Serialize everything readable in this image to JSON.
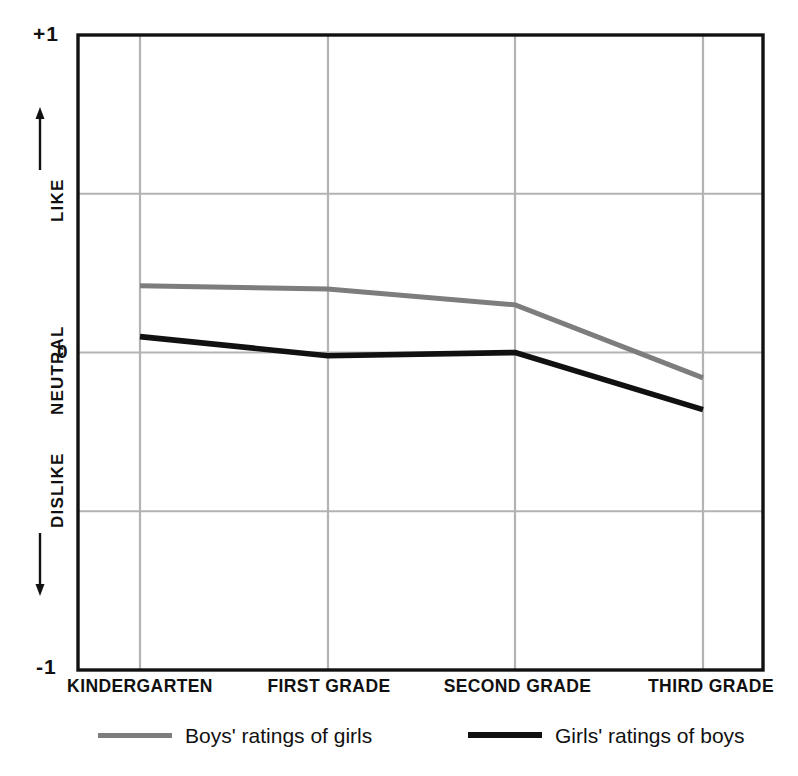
{
  "chart_data": {
    "type": "line",
    "title": "",
    "xlabel": "",
    "ylabel": "",
    "categories": [
      "KINDERGARTEN",
      "FIRST GRADE",
      "SECOND GRADE",
      "THIRD GRADE"
    ],
    "ylim": [
      -1,
      1
    ],
    "yticks": [
      1,
      0.5,
      0,
      -0.5,
      -1
    ],
    "ytick_labels": [
      "+1",
      "",
      "0",
      "",
      "-1"
    ],
    "grid": true,
    "legend_position": "bottom",
    "series": [
      {
        "name": "Boys' ratings of girls",
        "color": "#7d7d7d",
        "values": [
          0.21,
          0.2,
          0.15,
          -0.08
        ]
      },
      {
        "name": "Girls' ratings of boys",
        "color": "#111111",
        "values": [
          0.05,
          -0.01,
          0.0,
          -0.18
        ]
      }
    ]
  },
  "axis": {
    "y_top_label": "+1",
    "y_bottom_label": "-1",
    "y_zero_label": "0",
    "y_like_label": "LIKE",
    "y_neutral_label": "NEUTRAL",
    "y_dislike_label": "DISLIKE"
  },
  "legend": {
    "items": [
      {
        "label": "Boys' ratings of girls",
        "color": "#7d7d7d"
      },
      {
        "label": "Girls' ratings of boys",
        "color": "#111111"
      }
    ]
  },
  "colors": {
    "axis": "#111111",
    "grid": "#b3b3b3",
    "background": "#ffffff",
    "series_gray": "#7d7d7d",
    "series_black": "#111111"
  }
}
